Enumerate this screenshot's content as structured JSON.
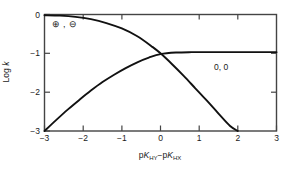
{
  "chart_data": {
    "type": "line",
    "title": "",
    "xlabel": "pK(HY) - pK(HX)",
    "ylabel": "Log k",
    "xlim": [
      -3,
      3
    ],
    "ylim": [
      -3,
      0
    ],
    "grid": false,
    "legend_position": "inline-annotation",
    "xticks": [
      "-3",
      "-2",
      "-1",
      "0",
      "1",
      "2",
      "3"
    ],
    "xtick_values": [
      -3,
      -2,
      -1,
      0,
      1,
      2,
      3
    ],
    "yticks": [
      "0",
      "-1",
      "-2",
      "-3"
    ],
    "ytick_values": [
      0,
      -1,
      -2,
      -3
    ],
    "series": [
      {
        "name": "charged-pair",
        "annotation": "⊕ , ⊖",
        "x": [
          -3.0,
          -2.6,
          -2.2,
          -1.8,
          -1.4,
          -1.0,
          -0.6,
          -0.2,
          0.0,
          0.3,
          0.6,
          0.9,
          1.2,
          1.5,
          1.8,
          2.0
        ],
        "values": [
          -0.02,
          -0.03,
          -0.06,
          -0.12,
          -0.22,
          -0.36,
          -0.56,
          -0.84,
          -1.0,
          -1.28,
          -1.58,
          -1.9,
          -2.22,
          -2.55,
          -2.87,
          -3.0
        ]
      },
      {
        "name": "neutral-pair",
        "annotation": "0, 0",
        "x": [
          -3.0,
          -2.7,
          -2.4,
          -2.1,
          -1.8,
          -1.5,
          -1.2,
          -0.9,
          -0.6,
          -0.3,
          0.0,
          0.4,
          0.8,
          1.2,
          1.6,
          2.0,
          2.4,
          3.0
        ],
        "values": [
          -3.0,
          -2.72,
          -2.45,
          -2.2,
          -1.96,
          -1.74,
          -1.55,
          -1.38,
          -1.23,
          -1.11,
          -1.02,
          -0.98,
          -0.97,
          -0.97,
          -0.97,
          -0.97,
          -0.97,
          -0.97
        ]
      }
    ]
  },
  "axes": {
    "ylabel_prefix": "Log ",
    "ylabel_symbol": "k",
    "xlabel_p1": "p",
    "xlabel_k1": "K",
    "xlabel_sub1": "HY",
    "xlabel_minus": "−",
    "xlabel_p2": "p",
    "xlabel_k2": "K",
    "xlabel_sub2": "HX",
    "xtick_0": "−3",
    "xtick_1": "−2",
    "xtick_2": "−1",
    "xtick_3": "0",
    "xtick_4": "1",
    "xtick_5": "2",
    "xtick_6": "3",
    "ytick_0": "0",
    "ytick_1": "−1",
    "ytick_2": "−2",
    "ytick_3": "−3"
  },
  "annotations": {
    "charged_legend": "⊕ , ⊖",
    "neutral_label": "0, 0"
  },
  "colors": {
    "curve": "#111111",
    "frame": "#444444",
    "text": "#1a1a1a",
    "background": "#ffffff"
  }
}
